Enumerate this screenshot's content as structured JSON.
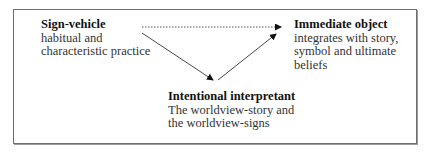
{
  "diagram": {
    "nodes": {
      "sign_vehicle": {
        "title": "Sign-vehicle",
        "desc_line1": "habitual and",
        "desc_line2": "characteristic practice"
      },
      "immediate_object": {
        "title": "Immediate object",
        "desc_line1": "integrates with story,",
        "desc_line2": "symbol and ultimate",
        "desc_line3": "beliefs"
      },
      "intentional_interpretant": {
        "title": "Intentional interpretant",
        "desc_line1": "The worldview-story and",
        "desc_line2": "the worldview-signs"
      }
    },
    "edges": [
      {
        "from": "sign_vehicle",
        "to": "immediate_object",
        "style": "dotted"
      },
      {
        "from": "sign_vehicle",
        "to": "intentional_interpretant",
        "style": "solid"
      },
      {
        "from": "intentional_interpretant",
        "to": "immediate_object",
        "style": "solid"
      }
    ],
    "colors": {
      "line": "#333333",
      "border": "#6e6e6e"
    }
  }
}
